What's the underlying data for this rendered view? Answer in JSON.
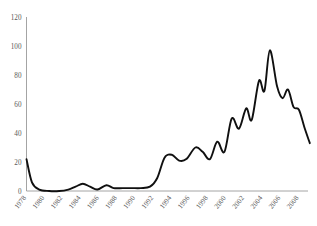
{
  "chart_data": {
    "type": "line",
    "title": "",
    "subtitle": "",
    "xlabel": "",
    "ylabel": "",
    "grid": false,
    "legend": "none",
    "line_color": "#101010",
    "axis_color": "#9a9a9a",
    "tick_label_color": "#595959",
    "xlim": [
      1978,
      2009
    ],
    "ylim": [
      0,
      120
    ],
    "yticks": [
      0,
      20,
      40,
      60,
      80,
      100,
      120
    ],
    "ytick_labels": [
      "0",
      "20",
      "40",
      "60",
      "80",
      "100",
      "120"
    ],
    "xticks": [
      1978,
      1980,
      1982,
      1984,
      1986,
      1988,
      1990,
      1992,
      1994,
      1996,
      1998,
      2000,
      2002,
      2004,
      2006,
      2008
    ],
    "xtick_labels": [
      "1978",
      "1980",
      "1982",
      "1984",
      "1986",
      "1988",
      "1990",
      "1992",
      "1994",
      "1996",
      "1998",
      "2000",
      "2002",
      "2004",
      "2006",
      "2008"
    ],
    "x": [
      1978,
      1979,
      1980,
      1981,
      1982,
      1983,
      1984,
      1985,
      1986,
      1987,
      1988,
      1989,
      1990,
      1991,
      1992,
      1993,
      1994,
      1995,
      1996,
      1997,
      1998,
      1999,
      2000,
      2001,
      2002,
      2003,
      2004,
      2005,
      2006,
      2007,
      2008,
      2009
    ],
    "values": [
      22,
      6,
      1,
      1,
      2,
      3,
      4,
      5,
      4,
      3,
      6,
      4,
      3,
      3,
      3,
      5,
      12,
      26,
      24,
      25,
      35,
      25,
      41,
      33,
      48,
      42,
      74,
      67,
      97,
      72,
      62,
      66
    ],
    "series": [
      {
        "name": "series-1",
        "values": [
          22,
          6,
          1,
          1,
          2,
          3,
          4,
          5,
          4,
          3,
          6,
          4,
          3,
          3,
          3,
          5,
          12,
          26,
          24,
          25,
          35,
          25,
          41,
          33,
          48,
          42,
          74,
          67,
          97,
          72,
          62,
          66
        ]
      }
    ],
    "points": [
      {
        "x": 1978.0,
        "y": 22
      },
      {
        "x": 1978.6,
        "y": 6
      },
      {
        "x": 1979.4,
        "y": 1
      },
      {
        "x": 1980.5,
        "y": 0
      },
      {
        "x": 1981.6,
        "y": 0
      },
      {
        "x": 1982.6,
        "y": 1
      },
      {
        "x": 1983.4,
        "y": 3
      },
      {
        "x": 1984.2,
        "y": 5
      },
      {
        "x": 1985.0,
        "y": 3
      },
      {
        "x": 1985.8,
        "y": 1
      },
      {
        "x": 1986.8,
        "y": 4
      },
      {
        "x": 1987.6,
        "y": 2
      },
      {
        "x": 1988.6,
        "y": 2
      },
      {
        "x": 1989.6,
        "y": 2
      },
      {
        "x": 1990.6,
        "y": 2
      },
      {
        "x": 1991.6,
        "y": 3
      },
      {
        "x": 1992.4,
        "y": 9
      },
      {
        "x": 1993.2,
        "y": 23
      },
      {
        "x": 1994.0,
        "y": 25
      },
      {
        "x": 1994.8,
        "y": 21
      },
      {
        "x": 1995.6,
        "y": 22
      },
      {
        "x": 1996.6,
        "y": 30
      },
      {
        "x": 1997.4,
        "y": 27
      },
      {
        "x": 1998.2,
        "y": 22
      },
      {
        "x": 1999.0,
        "y": 34
      },
      {
        "x": 1999.8,
        "y": 27
      },
      {
        "x": 2000.6,
        "y": 50
      },
      {
        "x": 2001.4,
        "y": 43
      },
      {
        "x": 2002.2,
        "y": 57
      },
      {
        "x": 2002.8,
        "y": 49
      },
      {
        "x": 2003.6,
        "y": 76
      },
      {
        "x": 2004.2,
        "y": 69
      },
      {
        "x": 2004.8,
        "y": 97
      },
      {
        "x": 2005.6,
        "y": 72
      },
      {
        "x": 2006.2,
        "y": 64
      },
      {
        "x": 2006.8,
        "y": 70
      },
      {
        "x": 2007.4,
        "y": 58
      },
      {
        "x": 2008.0,
        "y": 56
      },
      {
        "x": 2008.6,
        "y": 44
      },
      {
        "x": 2009.2,
        "y": 33
      }
    ],
    "annotations": []
  }
}
